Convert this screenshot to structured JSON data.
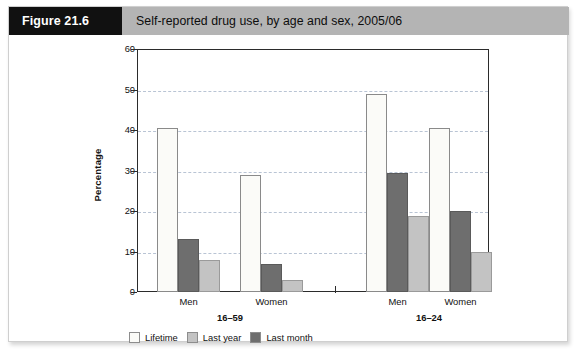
{
  "figure": {
    "number_label": "Figure 21.6",
    "title": "Self-reported drug use, by age and sex, 2005/06"
  },
  "chart_data": {
    "type": "bar",
    "title": "Self-reported drug use, by age and sex, 2005/06",
    "xlabel": "",
    "ylabel": "Percentage",
    "ylim": [
      0,
      60
    ],
    "yticks": [
      0,
      10,
      20,
      30,
      40,
      50,
      60
    ],
    "ytick_labels": [
      "0",
      "10",
      "20",
      "30",
      "40",
      "50",
      "60"
    ],
    "grid": true,
    "legend_position": "bottom-left",
    "categories": [
      "Men",
      "Women",
      "Men",
      "Women"
    ],
    "groups": [
      {
        "label": "16–59",
        "categories": [
          "Men",
          "Women"
        ]
      },
      {
        "label": "16–24",
        "categories": [
          "Men",
          "Women"
        ]
      }
    ],
    "series": [
      {
        "name": "Lifetime",
        "color": "#fbfbf8",
        "values": [
          40.5,
          29.0,
          49.0,
          40.5
        ]
      },
      {
        "name": "Last month",
        "color": "#6e6e6e",
        "values": [
          13.0,
          7.0,
          29.5,
          20.0
        ]
      },
      {
        "name": "Last year",
        "color": "#c3c3c3",
        "values": [
          8.0,
          3.0,
          18.8,
          10.0
        ]
      }
    ],
    "bar_order": [
      "Lifetime",
      "Last month",
      "Last year"
    ],
    "legend": [
      {
        "label": "Lifetime",
        "color": "#fbfbf8"
      },
      {
        "label": "Last year",
        "color": "#c3c3c3"
      },
      {
        "label": "Last month",
        "color": "#6e6e6e"
      }
    ]
  },
  "colors": {
    "header_number_bg": "#111111",
    "header_band_bg": "#b4b4b4",
    "axis": "#2b2b2b",
    "gridline": "#b9c4d4"
  }
}
